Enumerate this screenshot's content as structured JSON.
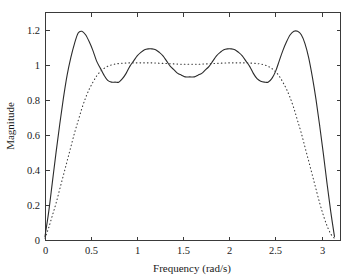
{
  "figure": {
    "background_color": "#ffffff",
    "axes_color": "#3a3a3a",
    "plot_box": {
      "left": 45,
      "top": 12,
      "right": 340,
      "bottom": 240
    }
  },
  "chart_data": {
    "type": "line",
    "title": "",
    "xlabel": "Frequency (rad/s)",
    "ylabel": "Magnitude",
    "xlim": [
      0,
      3.2
    ],
    "ylim": [
      0,
      1.3
    ],
    "xticks": [
      0,
      0.5,
      1,
      1.5,
      2,
      2.5,
      3
    ],
    "xticklabels": [
      "0",
      "0.5",
      "1",
      "1.5",
      "2",
      "2.5",
      "3"
    ],
    "yticks": [
      0,
      0.2,
      0.4,
      0.6,
      0.8,
      1,
      1.2
    ],
    "yticklabels": [
      "0",
      "0.2",
      "0.4",
      "0.6",
      "0.8",
      "1",
      "1.2"
    ],
    "grid": false,
    "legend": null,
    "series": [
      {
        "name": "equiripple-response",
        "style": "solid",
        "color": "#2b2b2b",
        "annotations": {
          "peaks_x": [
            0.37,
            1.16,
            1.98,
            2.77
          ],
          "peaks_y": [
            1.19,
            1.09,
            1.09,
            1.19
          ],
          "ripple_minima_x": [
            0.78,
            1.57,
            2.36
          ],
          "ripple_minima_y": [
            0.9,
            0.93,
            0.9
          ]
        },
        "x": [
          0.0,
          0.04,
          0.08,
          0.12,
          0.16,
          0.2,
          0.24,
          0.28,
          0.32,
          0.36,
          0.4,
          0.44,
          0.48,
          0.52,
          0.56,
          0.6,
          0.64,
          0.68,
          0.72,
          0.76,
          0.8,
          0.84,
          0.88,
          0.92,
          0.96,
          1.0,
          1.04,
          1.08,
          1.12,
          1.16,
          1.2,
          1.24,
          1.28,
          1.32,
          1.36,
          1.4,
          1.44,
          1.48,
          1.52,
          1.57,
          1.62,
          1.66,
          1.7,
          1.74,
          1.78,
          1.82,
          1.86,
          1.9,
          1.94,
          1.98,
          2.02,
          2.06,
          2.1,
          2.14,
          2.18,
          2.22,
          2.26,
          2.3,
          2.34,
          2.38,
          2.42,
          2.46,
          2.5,
          2.54,
          2.58,
          2.62,
          2.66,
          2.7,
          2.74,
          2.78,
          2.82,
          2.86,
          2.9,
          2.94,
          2.98,
          3.02,
          3.06,
          3.1,
          3.14
        ],
        "y": [
          0.02,
          0.16,
          0.33,
          0.5,
          0.66,
          0.81,
          0.94,
          1.04,
          1.12,
          1.18,
          1.19,
          1.17,
          1.13,
          1.08,
          1.02,
          0.98,
          0.94,
          0.91,
          0.9,
          0.9,
          0.9,
          0.92,
          0.95,
          0.99,
          1.02,
          1.05,
          1.07,
          1.085,
          1.09,
          1.09,
          1.085,
          1.07,
          1.05,
          1.02,
          0.99,
          0.97,
          0.95,
          0.94,
          0.93,
          0.93,
          0.93,
          0.94,
          0.95,
          0.97,
          0.99,
          1.02,
          1.05,
          1.07,
          1.085,
          1.09,
          1.09,
          1.085,
          1.07,
          1.05,
          1.02,
          0.99,
          0.95,
          0.92,
          0.905,
          0.9,
          0.9,
          0.92,
          0.96,
          1.02,
          1.08,
          1.13,
          1.17,
          1.19,
          1.19,
          1.17,
          1.12,
          1.04,
          0.93,
          0.8,
          0.65,
          0.49,
          0.32,
          0.16,
          0.02
        ]
      },
      {
        "name": "maximally-flat-response",
        "style": "dotted",
        "color": "#3c3c3c",
        "annotations": {
          "plateau_level": 1.01,
          "plateau_range_x": [
            0.7,
            2.45
          ]
        },
        "x": [
          0.0,
          0.04,
          0.08,
          0.12,
          0.16,
          0.2,
          0.24,
          0.28,
          0.32,
          0.36,
          0.4,
          0.44,
          0.48,
          0.52,
          0.56,
          0.6,
          0.64,
          0.68,
          0.72,
          0.76,
          0.8,
          0.84,
          0.88,
          0.92,
          0.96,
          1.0,
          1.04,
          1.08,
          1.12,
          1.16,
          1.2,
          1.24,
          1.28,
          1.32,
          1.36,
          1.4,
          1.44,
          1.48,
          1.52,
          1.57,
          1.62,
          1.66,
          1.7,
          1.74,
          1.78,
          1.82,
          1.86,
          1.9,
          1.94,
          1.98,
          2.02,
          2.06,
          2.1,
          2.14,
          2.18,
          2.22,
          2.26,
          2.3,
          2.34,
          2.38,
          2.42,
          2.46,
          2.5,
          2.54,
          2.58,
          2.62,
          2.66,
          2.7,
          2.74,
          2.78,
          2.82,
          2.86,
          2.9,
          2.94,
          2.98,
          3.02,
          3.06,
          3.1,
          3.14
        ],
        "y": [
          0.01,
          0.07,
          0.14,
          0.21,
          0.29,
          0.37,
          0.45,
          0.53,
          0.61,
          0.68,
          0.75,
          0.81,
          0.86,
          0.9,
          0.935,
          0.96,
          0.978,
          0.99,
          0.998,
          1.003,
          1.006,
          1.008,
          1.009,
          1.01,
          1.01,
          1.01,
          1.01,
          1.01,
          1.01,
          1.01,
          1.009,
          1.008,
          1.007,
          1.006,
          1.005,
          1.004,
          1.003,
          1.002,
          1.002,
          1.002,
          1.002,
          1.002,
          1.003,
          1.004,
          1.005,
          1.006,
          1.007,
          1.008,
          1.009,
          1.01,
          1.01,
          1.01,
          1.01,
          1.01,
          1.01,
          1.009,
          1.008,
          1.006,
          1.003,
          0.998,
          0.99,
          0.978,
          0.96,
          0.935,
          0.9,
          0.86,
          0.81,
          0.75,
          0.68,
          0.61,
          0.53,
          0.45,
          0.37,
          0.29,
          0.21,
          0.14,
          0.08,
          0.035,
          0.01
        ]
      }
    ]
  }
}
